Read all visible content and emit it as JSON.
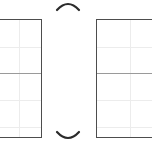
{
  "canvas": {
    "width": 152,
    "height": 152,
    "background": "#ffffff"
  },
  "colors": {
    "panel_border": "#4d4d4d",
    "panel_fill": "#ffffff",
    "gridline": "#ececec",
    "divider": "#9a9a9a",
    "arc_stroke": "#2b2b2b"
  },
  "panels": [
    {
      "name": "left-panel",
      "x": -18,
      "y": 19,
      "width": 60,
      "height": 119,
      "clipped_edge": "left",
      "divider_offset_y": 53,
      "gridlines": {
        "vertical_offsets_x": [
          36
        ],
        "horizontal_offsets_y": [
          27,
          80,
          107
        ]
      }
    },
    {
      "name": "right-panel",
      "x": 96,
      "y": 19,
      "width": 74,
      "height": 119,
      "clipped_edge": "right",
      "divider_offset_y": 53,
      "gridlines": {
        "vertical_offsets_x": [
          33
        ],
        "horizontal_offsets_y": [
          27,
          80,
          107
        ]
      }
    }
  ],
  "arcs": [
    {
      "name": "top-arc",
      "orientation": "concave-down",
      "x": 56,
      "y": -1,
      "width": 24,
      "height": 12,
      "stroke_width": 2.2,
      "path": "M 1 11 Q 12 -1 23 11"
    },
    {
      "name": "bottom-arc",
      "orientation": "concave-up",
      "x": 56,
      "y": 131,
      "width": 24,
      "height": 12,
      "stroke_width": 2.2,
      "path": "M 1 1 Q 12 13 23 1"
    }
  ]
}
